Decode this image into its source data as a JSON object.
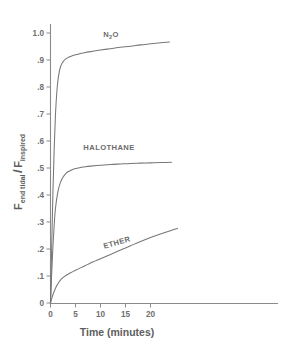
{
  "chart_data": {
    "type": "line",
    "title": "",
    "xlabel": "Time (minutes)",
    "ylabel": "Fend tidal / Finspired",
    "ylabel_parts": {
      "f1": "F",
      "sub1": "end tidal",
      "slash": "/",
      "f2": "F",
      "sub2": "inspired"
    },
    "xlim": [
      0,
      25.4
    ],
    "ylim": [
      0,
      1.05
    ],
    "grid": false,
    "legend_position": "inline-annotations",
    "xticks": [
      0,
      5,
      10,
      15,
      20
    ],
    "xtick_labels": [
      "0",
      "5",
      "10",
      "15",
      "20"
    ],
    "yticks": [
      0,
      0.1,
      0.2,
      0.3,
      0.4,
      0.5,
      0.6,
      0.7,
      0.8,
      0.9,
      1.0
    ],
    "ytick_labels": [
      "0",
      ".1",
      ".2",
      ".3",
      ".4",
      ".5",
      ".6",
      ".7",
      ".8",
      ".9",
      "1.0"
    ],
    "series": [
      {
        "name": "N2O",
        "label": "N₂O",
        "label_parts": {
          "pre": "N",
          "sub": "2",
          "post": "O"
        },
        "x": [
          0,
          0.25,
          0.5,
          0.75,
          1.0,
          1.3,
          1.6,
          2.0,
          2.5,
          3.0,
          3.5,
          4.0,
          5.0,
          6.0,
          7.0,
          8.0,
          9.0,
          10.0,
          12.0,
          14.0,
          16.0,
          18.0,
          20.0,
          22.0,
          23.8
        ],
        "values": [
          0.0,
          0.22,
          0.42,
          0.58,
          0.7,
          0.79,
          0.84,
          0.875,
          0.893,
          0.903,
          0.909,
          0.913,
          0.919,
          0.924,
          0.928,
          0.931,
          0.934,
          0.937,
          0.942,
          0.947,
          0.951,
          0.956,
          0.96,
          0.964,
          0.967
        ]
      },
      {
        "name": "HALOTHANE",
        "label": "HALOTHANE",
        "x": [
          0,
          0.25,
          0.5,
          0.75,
          1.0,
          1.5,
          2.0,
          2.5,
          3.0,
          3.5,
          4.0,
          5.0,
          6.0,
          7.0,
          8.0,
          10.0,
          12.0,
          14.0,
          16.0,
          18.0,
          20.0,
          22.0,
          24.2
        ],
        "values": [
          0.0,
          0.115,
          0.215,
          0.292,
          0.352,
          0.414,
          0.447,
          0.466,
          0.478,
          0.486,
          0.491,
          0.498,
          0.502,
          0.505,
          0.507,
          0.51,
          0.513,
          0.515,
          0.517,
          0.518,
          0.519,
          0.52,
          0.521
        ]
      },
      {
        "name": "ETHER",
        "label": "ETHER",
        "x": [
          0,
          0.3,
          0.6,
          1.0,
          1.5,
          2.0,
          2.5,
          3.0,
          4.0,
          5.0,
          6.0,
          7.0,
          8.0,
          9.0,
          10.0,
          12.0,
          14.0,
          16.0,
          18.0,
          20.0,
          22.0,
          24.0,
          25.4
        ],
        "values": [
          0.0,
          0.02,
          0.037,
          0.055,
          0.072,
          0.085,
          0.094,
          0.101,
          0.112,
          0.121,
          0.13,
          0.139,
          0.148,
          0.156,
          0.164,
          0.18,
          0.196,
          0.212,
          0.228,
          0.243,
          0.256,
          0.268,
          0.276
        ]
      }
    ],
    "annotations": [
      {
        "text": "N₂O",
        "x": 12.1,
        "y": 0.985,
        "rotation": 0
      },
      {
        "text": "HALOTHANE",
        "x": 11.7,
        "y": 0.567,
        "rotation": 0
      },
      {
        "text": "ETHER",
        "x": 13.4,
        "y": 0.215,
        "rotation": -16
      }
    ],
    "colors": {
      "curve": "#777777",
      "axis": "#8a8a8a",
      "text": "#5e5e5e",
      "background": "#ffffff"
    }
  }
}
